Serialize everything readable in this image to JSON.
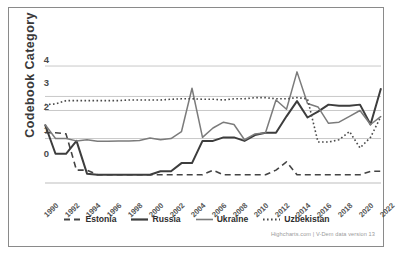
{
  "chart_data": {
    "type": "line",
    "title": "",
    "xlabel": "",
    "ylabel": "Codebook Category",
    "ylim": [
      -1.3,
      4.3
    ],
    "xlim": [
      1990,
      2022
    ],
    "grid": true,
    "legend_position": "bottom",
    "credits": "Highcharts.com | V-Dem data version 13",
    "ytick_labels": [
      "4",
      "3",
      "2",
      "1",
      "0"
    ],
    "ytick_values": [
      4,
      3,
      2,
      1,
      0
    ],
    "xtick_labels": [
      "1990",
      "1992",
      "1994",
      "1996",
      "1998",
      "2000",
      "2002",
      "2004",
      "2006",
      "2008",
      "2010",
      "2012",
      "2014",
      "2016",
      "2018",
      "2020",
      "2022"
    ],
    "xtick_values": [
      1990,
      1992,
      1994,
      1996,
      1998,
      2000,
      2002,
      2004,
      2006,
      2008,
      2010,
      2012,
      2014,
      2016,
      2018,
      2020,
      2022
    ],
    "x": [
      1990,
      1991,
      1992,
      1993,
      1994,
      1995,
      1996,
      1997,
      1998,
      1999,
      2000,
      2001,
      2002,
      2003,
      2004,
      2005,
      2006,
      2007,
      2008,
      2009,
      2010,
      2011,
      2012,
      2013,
      2014,
      2015,
      2016,
      2017,
      2018,
      2019,
      2020,
      2021,
      2022
    ],
    "series": [
      {
        "name": "Estonia",
        "color": "#444444",
        "dash": "6,4",
        "width": 1.6,
        "values": [
          0.85,
          0.85,
          0.8,
          -0.75,
          -0.75,
          -0.95,
          -0.95,
          -0.95,
          -0.95,
          -0.95,
          -0.95,
          -0.95,
          -0.95,
          -0.95,
          -0.95,
          -0.95,
          -0.75,
          -0.95,
          -0.95,
          -0.95,
          -0.95,
          -0.95,
          -0.75,
          -0.4,
          -0.95,
          -0.95,
          -0.95,
          -0.95,
          -0.95,
          -0.95,
          -0.95,
          -0.8,
          -0.8
        ]
      },
      {
        "name": "Russia",
        "color": "#3d3d3d",
        "dash": "none",
        "width": 2.0,
        "values": [
          1.2,
          -0.05,
          -0.05,
          0.5,
          -0.9,
          -0.95,
          -0.95,
          -0.95,
          -0.95,
          -0.95,
          -0.95,
          -0.8,
          -0.8,
          -0.45,
          -0.45,
          0.5,
          0.5,
          0.65,
          0.65,
          0.5,
          0.75,
          0.85,
          0.85,
          1.55,
          2.2,
          1.5,
          1.75,
          2.05,
          2.0,
          2.0,
          2.05,
          1.2,
          2.75
        ]
      },
      {
        "name": "Ukraine",
        "color": "#7b7b7b",
        "dash": "none",
        "width": 1.5,
        "values": [
          1.2,
          0.6,
          0.6,
          0.5,
          0.55,
          0.48,
          0.48,
          0.5,
          0.5,
          0.52,
          0.62,
          0.55,
          0.6,
          0.9,
          2.75,
          0.65,
          1.05,
          1.3,
          1.2,
          0.55,
          0.8,
          0.85,
          2.25,
          1.85,
          3.45,
          2.1,
          1.95,
          1.25,
          1.3,
          1.55,
          1.8,
          1.2,
          1.55
        ]
      },
      {
        "name": "Uzbekistan",
        "color": "#4a4a4a",
        "dash": "1.6,2.4",
        "width": 1.6,
        "values": [
          2.05,
          2.08,
          2.22,
          2.22,
          2.22,
          2.22,
          2.22,
          2.22,
          2.25,
          2.25,
          2.25,
          2.25,
          2.28,
          2.3,
          2.3,
          2.28,
          2.28,
          2.25,
          2.3,
          2.3,
          2.35,
          2.35,
          2.3,
          2.3,
          2.35,
          2.3,
          0.45,
          0.45,
          0.55,
          0.9,
          0.2,
          0.65,
          1.55
        ]
      }
    ]
  },
  "legend": {
    "items": [
      {
        "label": "Estonia",
        "key": "dashed-line-key"
      },
      {
        "label": "Russia",
        "key": "solid-bold-line-key"
      },
      {
        "label": "Ukraine",
        "key": "solid-thin-line-key"
      },
      {
        "label": "Uzbekistan",
        "key": "dotted-line-key"
      }
    ]
  }
}
